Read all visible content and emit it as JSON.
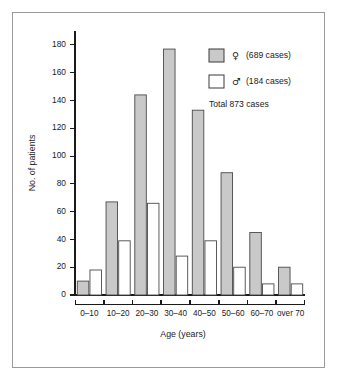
{
  "chart_data": {
    "type": "bar",
    "title": "",
    "xlabel": "Age (years)",
    "ylabel": "No. of patients",
    "categories": [
      "0–10",
      "10–20",
      "20–30",
      "30–40",
      "40–50",
      "50–60",
      "60–70",
      "over 70"
    ],
    "series": [
      {
        "name": "♀",
        "label": "(689 cases)",
        "color": "#c9c9c9",
        "values": [
          10,
          67,
          144,
          177,
          133,
          88,
          45,
          20
        ]
      },
      {
        "name": "♂",
        "label": "(184 cases)",
        "color": "#ffffff",
        "values": [
          18,
          39,
          66,
          28,
          39,
          20,
          8,
          8
        ]
      }
    ],
    "ylim": [
      0,
      190
    ],
    "yticks": [
      0,
      20,
      40,
      60,
      80,
      100,
      120,
      140,
      160,
      180
    ],
    "ytick_labels": [
      "0",
      "20",
      "40",
      "60",
      "80",
      "100",
      "120",
      "140",
      "160",
      "180"
    ],
    "grid": false,
    "legend_position": "top-right"
  },
  "legend": {
    "female_symbol": "♀",
    "female_cases": "(689 cases)",
    "male_symbol": "♂",
    "male_cases": "(184 cases)",
    "total": "Total 873 cases"
  },
  "colors": {
    "female_fill": "#c9c9c9",
    "male_fill": "#ffffff",
    "bar_stroke": "#4a4a4a",
    "axis": "#1a1a1a",
    "frame": "#9a9a9a"
  }
}
